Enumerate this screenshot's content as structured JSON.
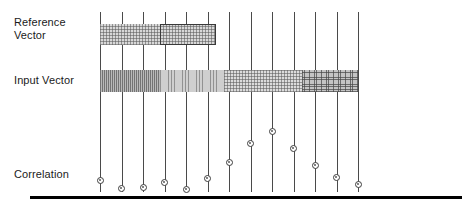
{
  "figure": {
    "background_color": "#ffffff",
    "line_color": "#4a4a4a",
    "baseline_color": "#000000",
    "marker_color": "#3d3d3d"
  },
  "labels": {
    "reference_vector": "Reference\nVector",
    "input_vector": "Input Vector",
    "correlation": "Correlation"
  },
  "axis": {
    "tick_count": 13,
    "first_tick_x": 100,
    "tick_spacing": 21.5,
    "tick_top_y": 12,
    "tick_bottom_y": 192,
    "baseline_y": 196,
    "baseline_left_x": 30,
    "baseline_right_x": 462,
    "baseline_thickness": 3
  },
  "reference_vector": {
    "bar_left_x": 100,
    "bar_right_x": 216,
    "bar_top_y": 24,
    "bar_height": 21,
    "fill_shade": "#d8d8d8",
    "hatch": "cross-hatch-light",
    "outlined_segment": {
      "left_x": 160,
      "right_x": 216,
      "border_color": "#3a3a3a"
    }
  },
  "input_vector": {
    "bar_left_x": 100,
    "bar_right_x": 358,
    "bar_top_y": 70,
    "bar_height": 22,
    "segments": [
      {
        "left_x": 100,
        "right_x": 160,
        "shade": "#b9b9b9",
        "hatch": "vertical-dense"
      },
      {
        "left_x": 160,
        "right_x": 224,
        "shade": "#cfcfcf",
        "hatch": "vertical-medium"
      },
      {
        "left_x": 224,
        "right_x": 302,
        "shade": "#dcdcdc",
        "hatch": "cross-hatch-light"
      },
      {
        "left_x": 302,
        "right_x": 358,
        "shade": "#c4c4c4",
        "hatch": "cross-hatch-medium"
      }
    ]
  },
  "chart_data": {
    "type": "scatter",
    "title": "Correlation",
    "xlabel": "",
    "ylabel": "Correlation",
    "grid": false,
    "legend_position": "none",
    "x": [
      1,
      2,
      3,
      4,
      5,
      6,
      7,
      8,
      9,
      10,
      11,
      12,
      13
    ],
    "x_pixels": [
      100,
      121.5,
      143,
      164.5,
      186,
      207.5,
      229,
      250.5,
      272,
      293.5,
      315,
      336.5,
      358
    ],
    "y_pixels": [
      180,
      188,
      187,
      182,
      189,
      178,
      162,
      143,
      131,
      148,
      165,
      177,
      184
    ],
    "values": [
      0.2,
      0.12,
      0.13,
      0.18,
      0.11,
      0.22,
      0.38,
      0.57,
      0.65,
      0.52,
      0.35,
      0.23,
      0.16
    ],
    "ylim": [
      0,
      1
    ],
    "marker": "circle-open",
    "annotations": []
  }
}
